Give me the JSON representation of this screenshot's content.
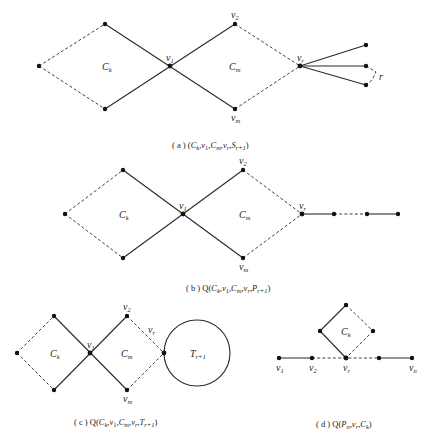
{
  "figure": {
    "panels": [
      {
        "id": "a",
        "caption": "( a ) (C_k,v_1,C_m,v_r,S_{r+1})",
        "caption_prefix": "( a )",
        "caption_body": "(C",
        "labels": {
          "cycle_left": "C",
          "cycle_left_sub": "k",
          "cycle_right": "C",
          "cycle_right_sub": "m",
          "v1": "v",
          "v1_sub": "1",
          "v2": "v",
          "v2_sub": "2",
          "vm": "v",
          "vm_sub": "m",
          "vr": "v",
          "vr_sub": "r",
          "star_count": "r"
        }
      },
      {
        "id": "b",
        "caption_prefix": "( b )",
        "caption": "Q(C_k,v_1,C_m,v_r,P_{r+1})",
        "labels": {
          "cycle_left": "C",
          "cycle_left_sub": "k",
          "cycle_right": "C",
          "cycle_right_sub": "m",
          "v1": "v",
          "v1_sub": "1",
          "v2": "v",
          "v2_sub": "2",
          "vm": "v",
          "vm_sub": "m",
          "vr": "v",
          "vr_sub": "r"
        }
      },
      {
        "id": "c",
        "caption_prefix": "( c )",
        "caption": "Q(C_k,v_1,C_m,v_r,T_{r+1})",
        "labels": {
          "cycle_left": "C",
          "cycle_left_sub": "k",
          "cycle_right": "C",
          "cycle_right_sub": "m",
          "v1": "v",
          "v1_sub": "1",
          "v2": "v",
          "v2_sub": "2",
          "vm": "v",
          "vm_sub": "m",
          "vr": "v",
          "vr_sub": "r",
          "tree": "T",
          "tree_sub": "r+1"
        }
      },
      {
        "id": "d",
        "caption_prefix": "( d )",
        "caption": "Q(P_n,v_r,C_k)",
        "labels": {
          "cycle": "C",
          "cycle_sub": "k",
          "v1": "v",
          "v1_sub": "1",
          "v2": "v",
          "v2_sub": "2",
          "vr": "v",
          "vr_sub": "r",
          "vn": "v",
          "vn_sub": "n"
        }
      }
    ],
    "captions": {
      "a": {
        "pre": "( a ) (",
        "C1": "C",
        "k": "k",
        "c1": ",",
        "v1": "v",
        "s1": "1",
        "c2": ",",
        "C2": "C",
        "m": "m",
        "c3": ",",
        "vr": "v",
        "r": "r",
        "c4": ",",
        "S": "S",
        "s": "r+1",
        "post": ")"
      },
      "b": {
        "pre": "( b ) Q(",
        "C1": "C",
        "k": "k",
        "c1": ",",
        "v1": "v",
        "s1": "1",
        "c2": ",",
        "C2": "C",
        "m": "m",
        "c3": ",",
        "vr": "v",
        "r": "r",
        "c4": ",",
        "S": "P",
        "s": "r+1",
        "post": ")"
      },
      "c": {
        "pre": "( c ) Q(",
        "C1": "C",
        "k": "k",
        "c1": ",",
        "v1": "v",
        "s1": "1",
        "c2": ",",
        "C2": "C",
        "m": "m",
        "c3": ",",
        "vr": "v",
        "r": "r",
        "c4": ",",
        "S": "T",
        "s": "r+1",
        "post": ")"
      },
      "d": {
        "pre": "( d ) Q(",
        "P": "P",
        "n": "n",
        "c1": ",",
        "vr": "v",
        "r": "r",
        "c2": ",",
        "C": "C",
        "k": "k",
        "post": ")"
      }
    }
  }
}
